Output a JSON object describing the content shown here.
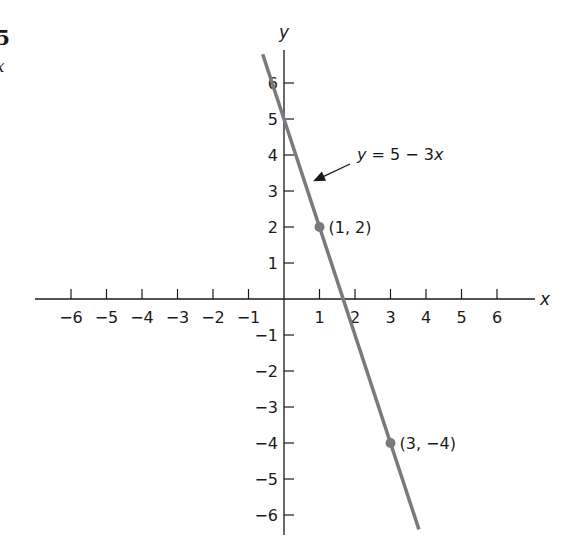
{
  "edge_fragments": {
    "top_left_number": "5",
    "top_left_var": "x"
  },
  "chart_data": {
    "type": "line",
    "title": "",
    "xlabel": "x",
    "ylabel": "y",
    "xlim": [
      -6.5,
      7
    ],
    "ylim": [
      -6.5,
      7
    ],
    "grid": false,
    "x_ticks": [
      -6,
      -5,
      -4,
      -3,
      -2,
      -1,
      1,
      2,
      3,
      4,
      5,
      6
    ],
    "x_tick_labels": [
      "−6",
      "−5",
      "−4",
      "−3",
      "−2",
      "−1",
      "1",
      "2",
      "3",
      "4",
      "5",
      "6"
    ],
    "y_ticks": [
      6,
      5,
      4,
      3,
      2,
      1,
      -1,
      -2,
      -3,
      -4,
      -5,
      -6
    ],
    "y_tick_labels": [
      "6",
      "5",
      "4",
      "3",
      "2",
      "1",
      "−1",
      "−2",
      "−3",
      "−4",
      "−5",
      "−6"
    ],
    "series": [
      {
        "name": "y = 5 − 3x",
        "equation": "y = 5 - 3x",
        "slope": -3,
        "intercept": 5,
        "x_range": [
          -0.6,
          3.8
        ],
        "color": "#7a7a7a"
      }
    ],
    "points": [
      {
        "x": 1,
        "y": 2,
        "label": "(1, 2)"
      },
      {
        "x": 3,
        "y": -4,
        "label": "(3, −4)"
      }
    ],
    "annotations": [
      {
        "text_y": "y",
        "text_rest": " = 5 − 3",
        "text_x": "x",
        "arrow_to": [
          0.65,
          3.3
        ]
      }
    ],
    "colors": {
      "axis": "#1a1a1a",
      "line": "#7a7a7a",
      "point": "#7a7a7a"
    }
  }
}
